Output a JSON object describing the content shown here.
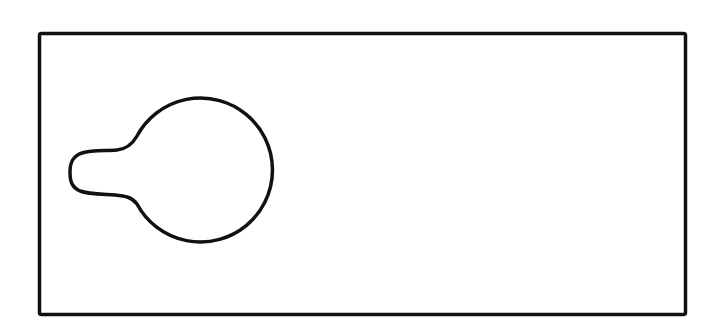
{
  "drawing": {
    "background": "#ffffff",
    "stroke_color": "#111111",
    "frame": {
      "x": 39,
      "y": 33,
      "width": 647,
      "height": 282,
      "stroke_width": 3.5
    },
    "keyhole_shape": {
      "circle_cx": 203,
      "circle_cy": 170,
      "circle_r": 72,
      "stroke_width": 3.5
    }
  }
}
